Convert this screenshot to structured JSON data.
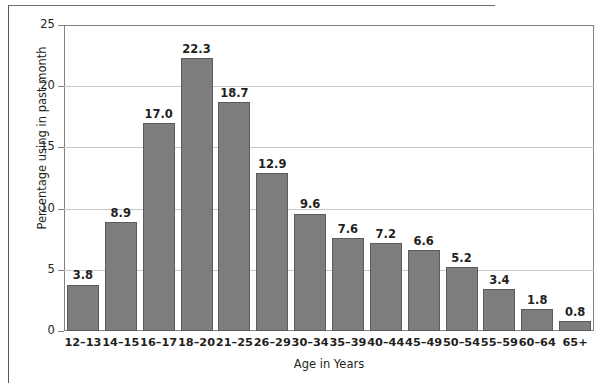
{
  "chart_data": {
    "type": "bar",
    "title": "",
    "subtitle": "",
    "xlabel": "Age in Years",
    "ylabel": "Percentage using in past month",
    "categories": [
      "12–13",
      "14–15",
      "16–17",
      "18–20",
      "21–25",
      "26–29",
      "30–34",
      "35–39",
      "40–44",
      "45–49",
      "50–54",
      "55–59",
      "60–64",
      "65+"
    ],
    "values": [
      3.8,
      8.9,
      17.0,
      22.3,
      18.7,
      12.9,
      9.6,
      7.6,
      7.2,
      6.6,
      5.2,
      3.4,
      1.8,
      0.8
    ],
    "value_labels": [
      "3.8",
      "8.9",
      "17.0",
      "22.3",
      "18.7",
      "12.9",
      "9.6",
      "7.6",
      "7.2",
      "6.6",
      "5.2",
      "3.4",
      "1.8",
      "0.8"
    ],
    "ylim": [
      0,
      25
    ],
    "yticks": [
      0,
      5,
      10,
      15,
      20,
      25
    ],
    "ytick_labels": [
      "0",
      "5",
      "10",
      "15",
      "20",
      "25"
    ],
    "grid": "horizontal",
    "legend": "none",
    "bar_color": "#7d7d7d",
    "bar_border_color": "#5b5b5b",
    "grid_color": "#c7c8ca",
    "frame_color": "#808285",
    "text_color": "#231f20"
  }
}
